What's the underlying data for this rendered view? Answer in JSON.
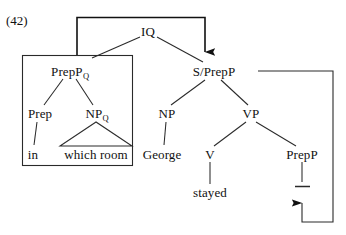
{
  "figure": {
    "example_number": "(42)",
    "type": "syntactic-tree-diagram",
    "ink_color": "#1a1a1a"
  },
  "nodes": {
    "iq": {
      "label": "IQ",
      "x": 148,
      "y": 31
    },
    "prepp_q": {
      "label": "PrepP",
      "sub": "Q",
      "x": 70,
      "y": 71
    },
    "prep": {
      "label": "Prep",
      "x": 40,
      "y": 113
    },
    "np_q": {
      "label": "NP",
      "sub": "Q",
      "x": 97,
      "y": 113
    },
    "in": {
      "label": "in",
      "x": 33,
      "y": 154
    },
    "which_room": {
      "label": "which room",
      "x": 96,
      "y": 154
    },
    "s_prepp": {
      "label": "S/PrepP",
      "x": 214,
      "y": 71
    },
    "np": {
      "label": "NP",
      "x": 167,
      "y": 113
    },
    "vp": {
      "label": "VP",
      "x": 251,
      "y": 113
    },
    "george": {
      "label": "George",
      "x": 162,
      "y": 154
    },
    "v": {
      "label": "V",
      "x": 210,
      "y": 154
    },
    "stayed": {
      "label": "stayed",
      "x": 210,
      "y": 192
    },
    "prepp_trace_parent": {
      "label": "PrepP",
      "x": 302,
      "y": 154
    }
  },
  "boxes": {
    "prepp_constituent": {
      "x": 22,
      "y": 55,
      "width": 111,
      "height": 111
    }
  },
  "movement": {
    "down_arrow": {
      "name": "prepp-to-s-prepp-arrow",
      "direction": "down",
      "tip_x": 205,
      "tip_y": 57
    },
    "up_arrow": {
      "name": "trace-to-prepp-arrow",
      "direction": "up",
      "tip_x": 302,
      "tip_y": 198
    },
    "trace_mark": {
      "name": "trace",
      "x": 302,
      "y": 186
    }
  }
}
